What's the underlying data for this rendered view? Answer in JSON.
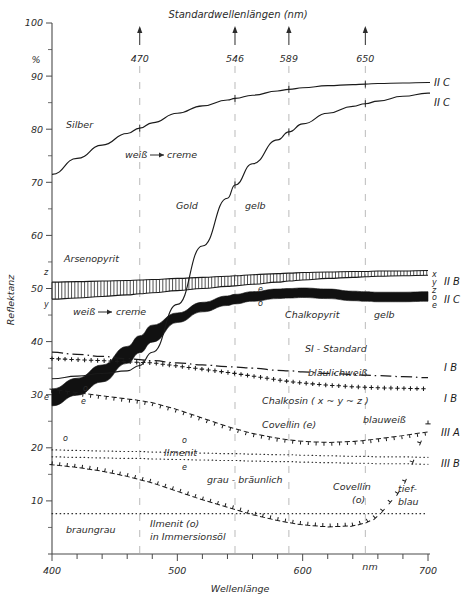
{
  "header": {
    "title": "Standardwellenlängen  (nm)",
    "standard_wavelengths": [
      470,
      546,
      589,
      650
    ]
  },
  "axes": {
    "y_title": "Reflektanz",
    "y_unit": "%",
    "y_ticks": [
      0,
      10,
      20,
      30,
      40,
      50,
      60,
      70,
      80,
      90,
      100
    ],
    "y_labeled": [
      10,
      20,
      30,
      40,
      50,
      60,
      70,
      80,
      90,
      100
    ],
    "ylim": [
      0,
      100
    ],
    "x_title": "Wellenlänge",
    "x_unit": "nm",
    "x_ticks": [
      400,
      420,
      440,
      460,
      480,
      500,
      520,
      540,
      560,
      580,
      600,
      620,
      640,
      660,
      680,
      700
    ],
    "x_labeled": [
      400,
      500,
      600,
      700
    ],
    "xlim": [
      400,
      700
    ]
  },
  "annotations": {
    "silber": "Silber",
    "weiss_creme_1": "weiß",
    "creme_1": "creme",
    "gold": "Gold",
    "gelb_gold": "gelb",
    "arsenopyrit": "Arsenopyrit",
    "weiss_creme_2": "weiß",
    "creme_2": "creme",
    "chalkopyrit": "Chalkopyrit",
    "gelb_cp": "gelb",
    "si_standard": "SI - Standard",
    "blaeulichweiss": "bläulichweiß",
    "chalkosin": "Chalkosin  ( x ~ y ~ z )",
    "covellin_e": "Covellin  (e)",
    "blauweiss": "blauweiß",
    "ilmenit": "Ilmenit",
    "grau_braeunlich": "grau - bräunlich",
    "covellin_o": "Covellin",
    "covellin_o_sub": "(o)",
    "tief": "tief-",
    "blau": "blau",
    "braungrau": "braungrau",
    "ilmenit_immersion_1": "Ilmenit (o)",
    "ilmenit_immersion_2": "in Immersionsöl"
  },
  "axis_markers": {
    "z": "z",
    "y": "y",
    "e_left_1": "e",
    "o_left": "o",
    "e_left_2": "e",
    "o_mid": "o",
    "e_mid": "e",
    "o_ilmenit": "o",
    "e_ilmenit": "e"
  },
  "right_labels": {
    "silber": "II  C",
    "gold": "II  C",
    "arsenopyrit_x": "x",
    "arsenopyrit_y": "y",
    "arsenopyrit_z": "z",
    "arsenopyrit_code": "II  B",
    "chalkopyrit_o": "o",
    "chalkopyrit_e": "e",
    "chalkopyrit_code": "II  C",
    "si_standard_code": "I  B",
    "chalkosin_code": "I  B",
    "covellin_e_code": "III  A",
    "ilmenit_code": "III  B"
  },
  "colors": {
    "ink": "#1a1a1a",
    "text": "#2b2b2b",
    "guide": "#9a9a9a"
  },
  "chart_data": {
    "type": "line",
    "title": "Standardwellenlängen  (nm)",
    "xlabel": "Wellenlänge",
    "ylabel": "Reflektanz",
    "xunit": "nm",
    "yunit": "%",
    "xlim": [
      400,
      700
    ],
    "ylim": [
      0,
      100
    ],
    "grid": "vertical guide lines at standard wavelengths 470, 546, 589, 650 nm",
    "legend": "right-edge curve codes (II C, II B, I B, III A, III B)",
    "x": [
      400,
      420,
      440,
      460,
      470,
      480,
      500,
      520,
      540,
      546,
      560,
      580,
      589,
      600,
      620,
      640,
      650,
      660,
      680,
      700
    ],
    "series": [
      {
        "name": "Silber",
        "code": "II C",
        "style": "solid-thin",
        "color_text": "weiß→creme",
        "values": [
          71.5,
          74.5,
          77.0,
          79.2,
          80.2,
          81.2,
          83.0,
          84.4,
          85.5,
          85.8,
          86.4,
          87.2,
          87.5,
          87.8,
          88.2,
          88.4,
          88.5,
          88.6,
          88.7,
          88.8
        ]
      },
      {
        "name": "Gold",
        "code": "II C",
        "style": "solid-thin",
        "color_text": "gelb",
        "values": [
          33.0,
          33.5,
          34.0,
          34.5,
          35.5,
          38.0,
          47.0,
          58.0,
          67.0,
          69.5,
          73.5,
          78.0,
          79.5,
          81.0,
          83.0,
          84.3,
          84.8,
          85.3,
          86.2,
          86.8
        ]
      },
      {
        "name": "Arsenopyrit",
        "code": "II B",
        "style": "comb-band",
        "color_text": "weiß→creme",
        "band_upper": [
          51.2,
          51.3,
          51.4,
          51.5,
          51.6,
          51.7,
          51.9,
          52.1,
          52.3,
          52.4,
          52.6,
          52.8,
          52.9,
          53.0,
          53.1,
          53.2,
          53.2,
          53.3,
          53.3,
          53.4
        ],
        "band_lower": [
          48.0,
          48.2,
          48.5,
          48.8,
          49.0,
          49.2,
          49.6,
          50.0,
          50.4,
          50.5,
          50.8,
          51.2,
          51.4,
          51.6,
          51.9,
          52.1,
          52.2,
          52.3,
          52.4,
          52.5
        ],
        "values": [
          49.6,
          49.8,
          50.0,
          50.2,
          50.3,
          50.5,
          50.8,
          51.1,
          51.4,
          51.5,
          51.7,
          52.0,
          52.2,
          52.3,
          52.5,
          52.7,
          52.7,
          52.8,
          52.9,
          53.0
        ]
      },
      {
        "name": "Chalkopyrit",
        "code": "II C",
        "style": "thick-solid-band",
        "color_text": "gelb",
        "values": [
          29.5,
          31.5,
          34.0,
          37.5,
          39.5,
          41.5,
          44.5,
          46.5,
          47.7,
          48.0,
          48.5,
          49.0,
          49.1,
          49.2,
          49.0,
          48.6,
          48.5,
          48.4,
          48.4,
          48.5
        ]
      },
      {
        "name": "SI - Standard",
        "code": "I B",
        "style": "dash-dot",
        "color_text": "bläulichweiß",
        "values": [
          38.0,
          37.6,
          37.2,
          36.8,
          36.6,
          36.4,
          36.0,
          35.6,
          35.3,
          35.2,
          35.0,
          34.6,
          34.5,
          34.3,
          34.0,
          33.8,
          33.7,
          33.6,
          33.4,
          33.2
        ]
      },
      {
        "name": "Chalkosin (x ~ y ~ z)",
        "code": "I B",
        "style": "plus-markers",
        "color_text": "bläulichweiß",
        "values": [
          36.8,
          36.6,
          36.4,
          36.2,
          36.1,
          36.0,
          35.4,
          34.8,
          34.2,
          34.0,
          33.5,
          32.8,
          32.5,
          32.2,
          31.8,
          31.5,
          31.4,
          31.3,
          31.2,
          31.1
        ]
      },
      {
        "name": "Covellin (e)",
        "code": "III A",
        "style": "tee-markers",
        "color_text": "blauweiß",
        "values": [
          31.0,
          30.4,
          29.8,
          29.2,
          28.9,
          28.5,
          27.2,
          25.6,
          24.0,
          23.6,
          22.7,
          21.8,
          21.5,
          21.2,
          21.0,
          21.2,
          21.4,
          21.7,
          22.3,
          23.0
        ]
      },
      {
        "name": "Ilmenit (o)",
        "code": "III A",
        "style": "dotted",
        "color_text": "grau - bräunlich",
        "values": [
          19.6,
          19.5,
          19.4,
          19.3,
          19.3,
          19.2,
          19.1,
          19.0,
          18.9,
          18.9,
          18.8,
          18.7,
          18.7,
          18.6,
          18.5,
          18.4,
          18.4,
          18.3,
          18.3,
          18.2
        ]
      },
      {
        "name": "Ilmenit (e)",
        "code": "III B",
        "style": "dotted",
        "color_text": "grau - bräunlich",
        "values": [
          18.3,
          18.2,
          18.1,
          18.0,
          18.0,
          17.9,
          17.8,
          17.7,
          17.6,
          17.6,
          17.5,
          17.4,
          17.4,
          17.3,
          17.2,
          17.1,
          17.1,
          17.0,
          17.0,
          16.9
        ]
      },
      {
        "name": "Covellin (o)",
        "code": "III B",
        "style": "tee-markers-down",
        "color_text": "tief-blau",
        "values": [
          16.8,
          16.3,
          15.6,
          14.6,
          14.0,
          13.4,
          11.8,
          10.2,
          8.8,
          8.4,
          7.4,
          6.3,
          5.9,
          5.5,
          5.1,
          5.3,
          5.8,
          7.0,
          12.5,
          24.5
        ]
      },
      {
        "name": "Ilmenit (o) in Immersionsöl",
        "code": "",
        "style": "dotted-flat",
        "color_text": "braungrau",
        "values": [
          7.6,
          7.6,
          7.6,
          7.6,
          7.6,
          7.6,
          7.6,
          7.6,
          7.6,
          7.6,
          7.6,
          7.6,
          7.6,
          7.6,
          7.6,
          7.6,
          7.6,
          7.6,
          7.6,
          7.6
        ]
      }
    ]
  }
}
